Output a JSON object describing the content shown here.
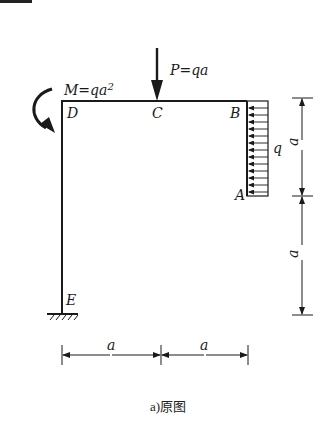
{
  "figure": {
    "caption": "a)原图",
    "points": {
      "D": "D",
      "C": "C",
      "B": "B",
      "A": "A",
      "E": "E"
    },
    "loads": {
      "point_load": "P=qa",
      "moment": "M=qa",
      "moment_exp": "2",
      "distributed": "q"
    },
    "dimensions": {
      "vertical_upper": "a",
      "vertical_lower": "a",
      "horizontal_left": "a",
      "horizontal_right": "a"
    },
    "colors": {
      "line": "#1a1a1a",
      "background": "#ffffff"
    }
  }
}
